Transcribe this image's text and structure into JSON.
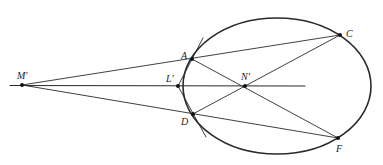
{
  "diagram": {
    "colors": {
      "stroke": "#2a2a2a",
      "background": "#ffffff"
    },
    "ellipse": {
      "cx": 277,
      "cy": 86,
      "rx": 94,
      "ry": 68
    },
    "points": {
      "M": {
        "label": "M'",
        "x": 22,
        "y": 85
      },
      "L": {
        "label": "L'",
        "x": 178,
        "y": 86
      },
      "A": {
        "label": "A",
        "x": 192,
        "y": 59
      },
      "D": {
        "label": "D",
        "x": 193,
        "y": 114
      },
      "N": {
        "label": "N'",
        "x": 245,
        "y": 86
      },
      "C": {
        "label": "C",
        "x": 340,
        "y": 35
      },
      "F": {
        "label": "F",
        "x": 338,
        "y": 138
      }
    },
    "labels": {
      "M": "M'",
      "L": "L'",
      "A": "A",
      "D": "D",
      "N": "N'",
      "C": "C",
      "F": "F"
    }
  }
}
